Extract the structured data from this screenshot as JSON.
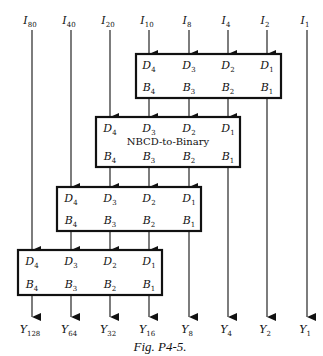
{
  "diagram": {
    "inputs": [
      {
        "name": "I",
        "sub": "80"
      },
      {
        "name": "I",
        "sub": "40"
      },
      {
        "name": "I",
        "sub": "20"
      },
      {
        "name": "I",
        "sub": "10"
      },
      {
        "name": "I",
        "sub": "8"
      },
      {
        "name": "I",
        "sub": "4"
      },
      {
        "name": "I",
        "sub": "2"
      },
      {
        "name": "I",
        "sub": "1"
      }
    ],
    "outputs": [
      {
        "name": "Y",
        "sub": "128"
      },
      {
        "name": "Y",
        "sub": "64"
      },
      {
        "name": "Y",
        "sub": "32"
      },
      {
        "name": "Y",
        "sub": "16"
      },
      {
        "name": "Y",
        "sub": "8"
      },
      {
        "name": "Y",
        "sub": "4"
      },
      {
        "name": "Y",
        "sub": "2"
      },
      {
        "name": "Y",
        "sub": "1"
      }
    ],
    "box_inputs": [
      {
        "name": "D",
        "sub": "4"
      },
      {
        "name": "D",
        "sub": "3"
      },
      {
        "name": "D",
        "sub": "2"
      },
      {
        "name": "D",
        "sub": "1"
      }
    ],
    "box_outputs": [
      {
        "name": "B",
        "sub": "4"
      },
      {
        "name": "B",
        "sub": "3"
      },
      {
        "name": "B",
        "sub": "2"
      },
      {
        "name": "B",
        "sub": "1"
      }
    ],
    "converter_label": "NBCD-to-Binary",
    "caption": "Fig. P4-5."
  },
  "colors": {
    "line": "#111111",
    "background": "#ffffff"
  }
}
